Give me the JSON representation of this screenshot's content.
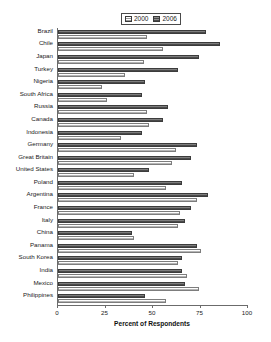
{
  "chart_data": {
    "type": "bar",
    "orientation": "horizontal",
    "title": "",
    "xlabel": "Percent of Respondents",
    "ylabel": "",
    "xlim": [
      0,
      100
    ],
    "xticks": [
      0,
      25,
      50,
      75,
      100
    ],
    "grid": false,
    "legend_position": "top-center",
    "categories": [
      "Brazil",
      "Chile",
      "Japan",
      "Turkey",
      "Nigeria",
      "South Africa",
      "Russia",
      "Canada",
      "Indonesia",
      "Germany",
      "Great Britain",
      "United States",
      "Poland",
      "Argentina",
      "France",
      "Italy",
      "China",
      "Panama",
      "South Korea",
      "India",
      "Mexico",
      "Philippines"
    ],
    "series": [
      {
        "name": "2000",
        "values": [
          47,
          55,
          45,
          35,
          23,
          26,
          47,
          48,
          33,
          62,
          60,
          40,
          57,
          73,
          64,
          63,
          40,
          75,
          63,
          68,
          74,
          57
        ]
      },
      {
        "name": "2006",
        "values": [
          78,
          85,
          74,
          63,
          46,
          44,
          58,
          55,
          44,
          73,
          70,
          48,
          65,
          79,
          70,
          67,
          39,
          73,
          65,
          65,
          67,
          46
        ]
      }
    ],
    "colors": {
      "series_2000": "#b5b5b5",
      "series_2006": "#4a4a4a",
      "axis": "#6b6b6b",
      "text": "#1a1a1a",
      "background": "#ffffff"
    }
  },
  "legend": {
    "entries": [
      {
        "label": "2000",
        "swatch": "hatch-light-swatch"
      },
      {
        "label": "2006",
        "swatch": "hatch-dark-swatch"
      }
    ]
  },
  "axis": {
    "x_title": "Percent of Respondents",
    "tick_labels": [
      "0",
      "25",
      "50",
      "75",
      "100"
    ]
  }
}
